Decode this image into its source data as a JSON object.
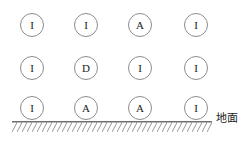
{
  "figure": {
    "background_color": "#ffffff",
    "stroke_color": "#8c8c8c",
    "text_color": "#1a1a1a",
    "grid": {
      "columns": 4,
      "rows": 3,
      "column_centers_px": [
        32,
        86,
        140,
        196
      ],
      "row_centers_px": [
        25,
        68,
        108
      ],
      "node_diameter_px": 24,
      "nodes": [
        {
          "row": 0,
          "col": 0,
          "label": "I"
        },
        {
          "row": 0,
          "col": 1,
          "label": "I"
        },
        {
          "row": 0,
          "col": 2,
          "label": "A"
        },
        {
          "row": 0,
          "col": 3,
          "label": "I"
        },
        {
          "row": 1,
          "col": 0,
          "label": "I"
        },
        {
          "row": 1,
          "col": 1,
          "label": "D"
        },
        {
          "row": 1,
          "col": 2,
          "label": "I"
        },
        {
          "row": 1,
          "col": 3,
          "label": "I"
        },
        {
          "row": 2,
          "col": 0,
          "label": "I"
        },
        {
          "row": 2,
          "col": 1,
          "label": "A"
        },
        {
          "row": 2,
          "col": 2,
          "label": "A"
        },
        {
          "row": 2,
          "col": 3,
          "label": "I"
        }
      ]
    },
    "ground": {
      "label": "地面",
      "line_start_x_px": 12,
      "line_end_x_px": 212,
      "line_y_px": 122,
      "hatch_band_height_px": 8,
      "hatch_direction": "forward-slash"
    }
  }
}
